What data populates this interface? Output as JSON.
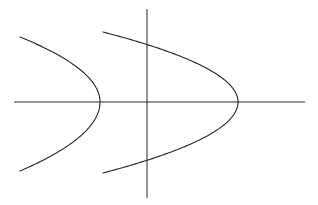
{
  "figure": {
    "background_color": "#ffffff",
    "stroke_color": "#2b2b2b",
    "width": 318,
    "height": 205
  },
  "chart_data": {
    "type": "line",
    "title": "",
    "subtitle": "",
    "xlabel": "",
    "ylabel": "",
    "grid": false,
    "legend_position": "none",
    "xlim": [
      -5.5,
      5.5
    ],
    "ylim": [
      -3.2,
      3.2
    ],
    "axes": {
      "x_axis": {
        "name": "x-axis",
        "orientation": "horizontal",
        "pixel_y": 102,
        "pixel_x_start": 14,
        "pixel_x_end": 305,
        "tick_labels": [],
        "arrowheads": false
      },
      "y_axis": {
        "name": "y-axis",
        "orientation": "vertical",
        "pixel_x": 147,
        "pixel_y_start": 9,
        "pixel_y_end": 198,
        "tick_labels": [],
        "arrowheads": false
      },
      "origin": {
        "pixel_x": 147,
        "pixel_y": 102
      }
    },
    "series": [
      {
        "name": "left-parabola",
        "opens": "left",
        "vertex_pixel": {
          "x": 100,
          "y": 102
        },
        "vertex_data": {
          "x": -1.78,
          "y": 0
        },
        "half_width_pixels": 80,
        "half_height_pixels": 66,
        "endpoints_pixel": [
          {
            "x": 20,
            "y": 37
          },
          {
            "x": 20,
            "y": 171
          }
        ],
        "points_pixel": [
          {
            "x": 20,
            "y": 37
          },
          {
            "x": 44,
            "y": 46
          },
          {
            "x": 66,
            "y": 59
          },
          {
            "x": 85,
            "y": 77
          },
          {
            "x": 96,
            "y": 93
          },
          {
            "x": 100,
            "y": 102
          },
          {
            "x": 96,
            "y": 112
          },
          {
            "x": 85,
            "y": 128
          },
          {
            "x": 66,
            "y": 147
          },
          {
            "x": 44,
            "y": 161
          },
          {
            "x": 20,
            "y": 171
          }
        ]
      },
      {
        "name": "right-parabola",
        "opens": "left",
        "vertex_pixel": {
          "x": 238,
          "y": 102
        },
        "vertex_data": {
          "x": 3.38,
          "y": 0
        },
        "half_width_pixels": 135,
        "half_height_pixels": 70,
        "endpoints_pixel": [
          {
            "x": 103,
            "y": 32
          },
          {
            "x": 103,
            "y": 173
          }
        ],
        "points_pixel": [
          {
            "x": 103,
            "y": 32
          },
          {
            "x": 140,
            "y": 38
          },
          {
            "x": 176,
            "y": 50
          },
          {
            "x": 208,
            "y": 67
          },
          {
            "x": 230,
            "y": 89
          },
          {
            "x": 238,
            "y": 102
          },
          {
            "x": 231,
            "y": 116
          },
          {
            "x": 210,
            "y": 137
          },
          {
            "x": 178,
            "y": 155
          },
          {
            "x": 141,
            "y": 168
          },
          {
            "x": 103,
            "y": 173
          }
        ]
      }
    ]
  }
}
